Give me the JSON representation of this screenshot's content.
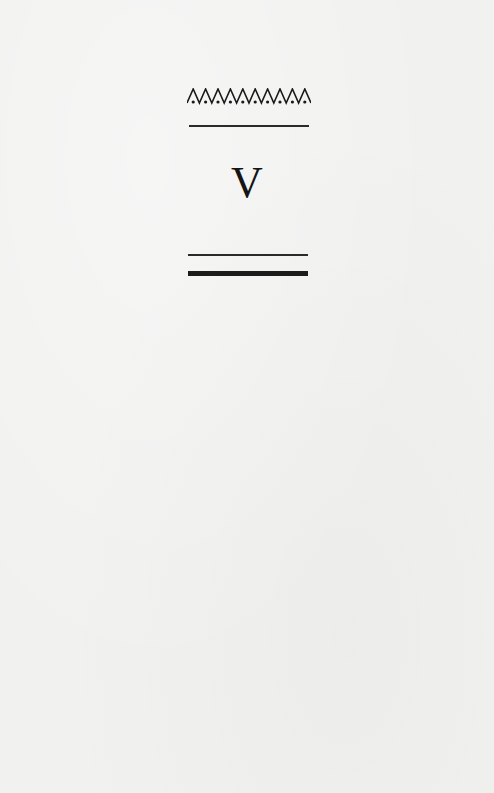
{
  "page": {
    "background_color": "#f1f1f0",
    "ink_color": "#1a1a1a"
  },
  "header_ornament": {
    "icon": "chevron-dot-border-icon",
    "peak_count": 10
  },
  "chapter": {
    "numeral": "V"
  },
  "rules": {
    "top": "single-thin",
    "bottom": [
      "thin",
      "thick"
    ]
  }
}
